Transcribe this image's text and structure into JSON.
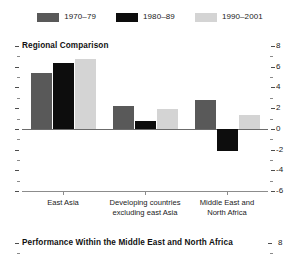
{
  "legend": {
    "items": [
      {
        "label": "1970–79",
        "color": "#595959"
      },
      {
        "label": "1980–89",
        "color": "#0d0d0d"
      },
      {
        "label": "1990–2001",
        "color": "#d4d4d4"
      }
    ]
  },
  "panels": [
    {
      "title": "Regional Comparison"
    },
    {
      "title": "Performance Within the Middle East and North Africa"
    }
  ],
  "axis": {
    "ticks": [
      "8",
      "6",
      "4",
      "2",
      "0",
      "-2",
      "-4",
      "-6"
    ],
    "panel2_top_tick": "8"
  },
  "chart_data": {
    "type": "bar",
    "title": "Regional Comparison",
    "xlabel": "",
    "ylabel": "",
    "ylim": [
      -6,
      8
    ],
    "ytick_values": [
      8,
      6,
      4,
      2,
      0,
      -2,
      -4,
      -6
    ],
    "ytick_labels": [
      "8",
      "6",
      "4",
      "2",
      "0",
      "-2",
      "-4",
      "-6"
    ],
    "grid": false,
    "legend_position": "top-center",
    "categories": [
      "East Asia",
      "Developing countries\nexcluding east Asia",
      "Middle East and\nNorth Africa"
    ],
    "series": [
      {
        "name": "1970–79",
        "color": "#595959",
        "values": [
          5.4,
          2.2,
          2.8
        ]
      },
      {
        "name": "1980–89",
        "color": "#0d0d0d",
        "values": [
          6.4,
          0.8,
          -2.1
        ]
      },
      {
        "name": "1990–2001",
        "color": "#d4d4d4",
        "values": [
          6.7,
          1.9,
          1.3
        ]
      }
    ]
  }
}
